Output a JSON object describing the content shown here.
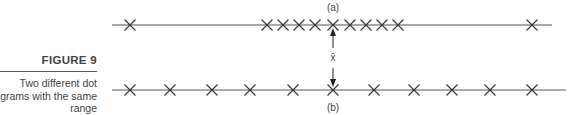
{
  "figure": {
    "title": "FIGURE 9",
    "description_lines": [
      "Two different dot",
      "grams with the same",
      "range"
    ]
  },
  "diagram": {
    "label_a": "(a)",
    "label_b": "(b)",
    "mean_label": "x̄",
    "line_color": "#555555"
  },
  "chart_data": {
    "type": "scatter",
    "series": [
      {
        "name": "(a)",
        "x_positions_px": [
          130,
          267,
          283,
          299,
          315,
          333,
          350,
          366,
          382,
          398,
          532
        ]
      },
      {
        "name": "(b)",
        "x_positions_px": [
          130,
          170,
          212,
          250,
          293,
          333,
          374,
          414,
          452,
          490,
          532
        ]
      }
    ],
    "annotations": [
      "mean x̄ at center for both diagrams"
    ]
  }
}
